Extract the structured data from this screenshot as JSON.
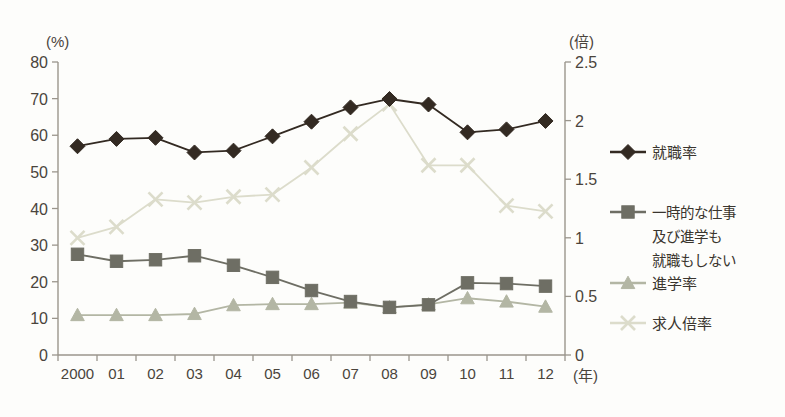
{
  "chart_data": {
    "type": "line",
    "title": "",
    "subtitle": "",
    "xlabel": "(年)",
    "ylabel": "(%)",
    "y2label": "(倍)",
    "categories": [
      "2000",
      "01",
      "02",
      "03",
      "04",
      "05",
      "06",
      "07",
      "08",
      "09",
      "10",
      "11",
      "12"
    ],
    "ylim": [
      0,
      80
    ],
    "yticks": [
      0,
      10,
      20,
      30,
      40,
      50,
      60,
      70,
      80
    ],
    "y2lim": [
      0,
      2.5
    ],
    "y2ticks": [
      "0",
      "0.5",
      "1",
      "1.5",
      "2",
      "2.5"
    ],
    "grid": false,
    "legend_position": "right",
    "series": [
      {
        "name": "就職率",
        "axis": "left",
        "unit": "%",
        "marker": "diamond",
        "color": "#332a22",
        "values": [
          57.0,
          59.0,
          59.3,
          55.3,
          55.8,
          59.7,
          63.7,
          67.6,
          69.9,
          68.4,
          60.8,
          61.6,
          63.9
        ]
      },
      {
        "name": "一時的な仕事及び進学も就職もしない",
        "name_lines": [
          "一時的な仕事",
          "及び進学も",
          "就職もしない"
        ],
        "axis": "left",
        "unit": "%",
        "marker": "square",
        "color": "#6e6e64",
        "values": [
          27.5,
          25.6,
          26.0,
          27.1,
          24.5,
          21.2,
          17.6,
          14.6,
          13.0,
          13.7,
          19.7,
          19.5,
          18.8
        ]
      },
      {
        "name": "進学率",
        "axis": "left",
        "unit": "%",
        "marker": "triangle",
        "color": "#b3b6a4",
        "values": [
          10.9,
          10.9,
          10.9,
          11.2,
          13.6,
          13.9,
          13.9,
          14.3,
          13.0,
          13.8,
          15.5,
          14.6,
          13.2
        ]
      },
      {
        "name": "求人倍率",
        "axis": "right",
        "unit": "倍",
        "marker": "cross",
        "color": "#dcdccb",
        "values": [
          1.0,
          1.09,
          1.33,
          1.3,
          1.35,
          1.37,
          1.6,
          1.89,
          2.14,
          1.62,
          1.62,
          1.28,
          1.23
        ],
        "values_on_left_scale": [
          32.0,
          35.0,
          42.5,
          41.6,
          43.2,
          43.8,
          51.2,
          60.4,
          68.5,
          51.8,
          51.8,
          40.8,
          39.2
        ]
      }
    ]
  },
  "legend": {
    "items": [
      {
        "label": "就職率",
        "marker": "diamond"
      },
      {
        "label_lines": [
          "一時的な仕事",
          "及び進学も",
          "就職もしない"
        ],
        "marker": "square"
      },
      {
        "label": "進学率",
        "marker": "triangle"
      },
      {
        "label": "求人倍率",
        "marker": "cross"
      }
    ]
  },
  "colors": {
    "series_1": "#332a22",
    "series_2": "#6e6e64",
    "series_3": "#b3b6a4",
    "series_4": "#dcdccb",
    "axis": "#9a958c",
    "text": "#4a443c",
    "background": "#fdfdfb"
  }
}
